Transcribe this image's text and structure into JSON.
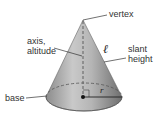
{
  "diagram": {
    "labels": {
      "vertex": "vertex",
      "axis_line1": "axis,",
      "axis_line2": "altitude",
      "slant_symbol": "ℓ",
      "slant_line1": "slant",
      "slant_line2": "height",
      "base": "base",
      "radius_symbol": "r"
    },
    "colors": {
      "cone_light": "#c8c8c8",
      "cone_dark": "#7a7a7a",
      "base_fill": "#9a9a9a",
      "line": "#333333",
      "dashed": "#555555"
    }
  }
}
